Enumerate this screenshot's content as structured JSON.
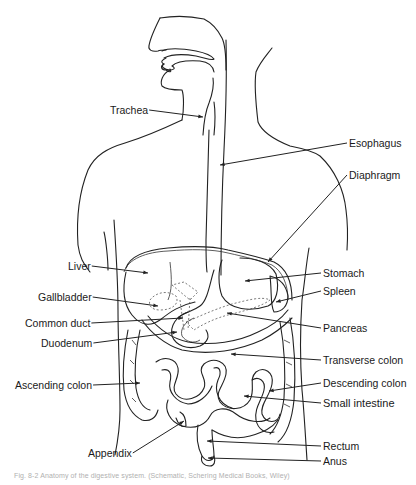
{
  "figure": {
    "type": "anatomical-diagram",
    "labels": [
      {
        "id": "trachea",
        "text": "Trachea",
        "x": 110,
        "y": 110,
        "target": [
          203,
          117
        ]
      },
      {
        "id": "esophagus",
        "text": "Esophagus",
        "x": 349,
        "y": 143,
        "target": [
          220,
          165
        ]
      },
      {
        "id": "diaphragm",
        "text": "Diaphragm",
        "x": 349,
        "y": 175,
        "target": [
          268,
          262
        ]
      },
      {
        "id": "liver",
        "text": "Liver",
        "x": 68,
        "y": 266,
        "target": [
          148,
          273
        ]
      },
      {
        "id": "stomach",
        "text": "Stomach",
        "x": 323,
        "y": 273,
        "target": [
          245,
          281
        ]
      },
      {
        "id": "gallbladder",
        "text": "Gallbladder",
        "x": 38,
        "y": 297,
        "target": [
          158,
          306
        ]
      },
      {
        "id": "spleen",
        "text": "Spleen",
        "x": 323,
        "y": 291,
        "target": [
          276,
          302
        ]
      },
      {
        "id": "common-duct",
        "text": "Common duct",
        "x": 25,
        "y": 323,
        "target": [
          183,
          318
        ]
      },
      {
        "id": "pancreas",
        "text": "Pancreas",
        "x": 323,
        "y": 328,
        "target": [
          227,
          313
        ]
      },
      {
        "id": "duodenum",
        "text": "Duodenum",
        "x": 41,
        "y": 343,
        "target": [
          177,
          332
        ]
      },
      {
        "id": "transverse-colon",
        "text": "Transverse colon",
        "x": 323,
        "y": 360,
        "target": [
          231,
          354
        ]
      },
      {
        "id": "ascending-colon",
        "text": "Ascending colon",
        "x": 15,
        "y": 385,
        "target": [
          140,
          383
        ]
      },
      {
        "id": "descending-colon",
        "text": "Descending colon",
        "x": 323,
        "y": 383,
        "target": [
          269,
          391
        ]
      },
      {
        "id": "small-intestine",
        "text": "Small intestine",
        "x": 323,
        "y": 403,
        "target": [
          244,
          396
        ]
      },
      {
        "id": "appendix",
        "text": "Appendix",
        "x": 88,
        "y": 453,
        "target": [
          184,
          421
        ]
      },
      {
        "id": "rectum",
        "text": "Rectum",
        "x": 323,
        "y": 446,
        "target": [
          207,
          441
        ]
      },
      {
        "id": "anus",
        "text": "Anus",
        "x": 323,
        "y": 461,
        "target": [
          208,
          458
        ]
      }
    ],
    "caption": "Fig. 8-2  Anatomy of the digestive system.  (Schematic, Schering Medical Books, Wiley)"
  },
  "colors": {
    "background": "#ffffff",
    "line": "#222222",
    "label": "#1a1a1a",
    "caption": "#b0b0b0"
  }
}
